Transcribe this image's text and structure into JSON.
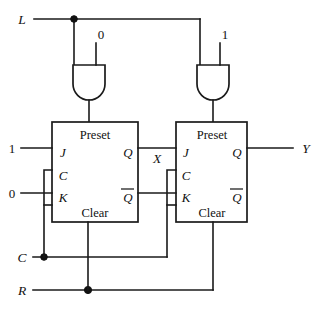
{
  "figure": {
    "type": "logic-circuit-diagram",
    "background_color": "#ffffff",
    "line_color": "#1a1a1a"
  },
  "inputs": {
    "load": "L",
    "clock": "C",
    "reset": "R",
    "j1_constant": "1",
    "k1_constant": "0",
    "gate_left_constant": "0",
    "gate_right_constant": "1"
  },
  "outputs": {
    "intermediate": "X",
    "final": "Y"
  },
  "gates": [
    {
      "id": "and-gate-left",
      "type": "AND",
      "orientation": "down",
      "input_left": "L",
      "input_right": "0",
      "drives": "Preset of flip-flop 1"
    },
    {
      "id": "and-gate-right",
      "type": "AND",
      "orientation": "down",
      "input_left": "L",
      "input_right": "1",
      "drives": "Preset of flip-flop 2"
    }
  ],
  "flipflops": [
    {
      "id": "flipflop-1",
      "type": "JK",
      "preset_label": "Preset",
      "clear_label": "Clear",
      "pin_j": "J",
      "pin_c": "C",
      "pin_k": "K",
      "pin_q": "Q",
      "pin_qbar": "Q",
      "qbar_has_overbar": true,
      "output_signal": "X"
    },
    {
      "id": "flipflop-2",
      "type": "JK",
      "preset_label": "Preset",
      "clear_label": "Clear",
      "pin_j": "J",
      "pin_c": "C",
      "pin_k": "K",
      "pin_q": "Q",
      "pin_qbar": "Q",
      "qbar_has_overbar": true,
      "output_signal": "Y"
    }
  ],
  "junctions": [
    {
      "name": "load-junction",
      "signal": "L"
    },
    {
      "name": "clock-junction",
      "signal": "C"
    },
    {
      "name": "reset-junction",
      "signal": "R"
    }
  ]
}
